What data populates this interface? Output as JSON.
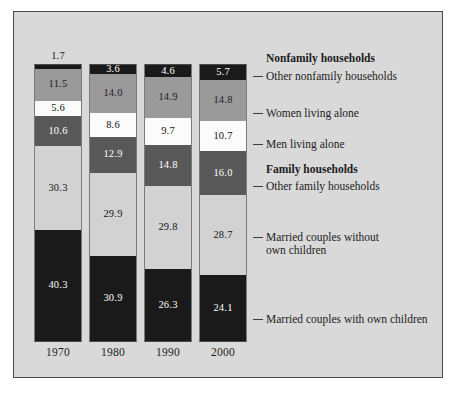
{
  "chart_data": {
    "type": "bar",
    "subtype": "stacked-100-percent",
    "title": "",
    "xlabel": "",
    "ylabel": "",
    "ylim": [
      0,
      100
    ],
    "grid": false,
    "legend_position": "right",
    "categories": [
      "1970",
      "1980",
      "1990",
      "2000"
    ],
    "series": [
      {
        "name": "Other nonfamily households",
        "color": "#1a1a1a",
        "values": [
          1.7,
          3.6,
          4.6,
          5.7
        ]
      },
      {
        "name": "Women living alone",
        "color": "#9a9a9a",
        "values": [
          11.5,
          14.0,
          14.9,
          14.8
        ]
      },
      {
        "name": "Men living alone",
        "color": "#fbfbfb",
        "values": [
          5.6,
          8.6,
          9.7,
          10.7
        ]
      },
      {
        "name": "Other family households",
        "color": "#585858",
        "values": [
          10.6,
          12.9,
          14.8,
          16.0
        ]
      },
      {
        "name": "Married couples without own children",
        "color": "#d2d2d2",
        "values": [
          30.3,
          29.9,
          29.8,
          28.7
        ]
      },
      {
        "name": "Married couples with own children",
        "color": "#1a1a1a",
        "values": [
          40.3,
          30.9,
          26.3,
          24.1
        ]
      }
    ],
    "group_headers": [
      "Nonfamily households",
      "Family households"
    ]
  },
  "bars": [
    {
      "year": "1970",
      "segments": [
        {
          "value": "1.7",
          "tone": "c-black",
          "pct": 1.7,
          "outside": true
        },
        {
          "value": "11.5",
          "tone": "c-mid",
          "pct": 11.5,
          "outside": false
        },
        {
          "value": "5.6",
          "tone": "c-white",
          "pct": 5.6,
          "outside": false
        },
        {
          "value": "10.6",
          "tone": "c-dark",
          "pct": 10.6,
          "outside": false
        },
        {
          "value": "30.3",
          "tone": "c-light",
          "pct": 30.3,
          "outside": false
        },
        {
          "value": "40.3",
          "tone": "c-black",
          "pct": 40.3,
          "outside": false
        }
      ]
    },
    {
      "year": "1980",
      "segments": [
        {
          "value": "3.6",
          "tone": "c-black",
          "pct": 3.6,
          "outside": false
        },
        {
          "value": "14.0",
          "tone": "c-mid",
          "pct": 14.0,
          "outside": false
        },
        {
          "value": "8.6",
          "tone": "c-white",
          "pct": 8.6,
          "outside": false
        },
        {
          "value": "12.9",
          "tone": "c-dark",
          "pct": 12.9,
          "outside": false
        },
        {
          "value": "29.9",
          "tone": "c-light",
          "pct": 29.9,
          "outside": false
        },
        {
          "value": "30.9",
          "tone": "c-black",
          "pct": 30.9,
          "outside": false
        }
      ]
    },
    {
      "year": "1990",
      "segments": [
        {
          "value": "4.6",
          "tone": "c-black",
          "pct": 4.6,
          "outside": false
        },
        {
          "value": "14.9",
          "tone": "c-mid",
          "pct": 14.9,
          "outside": false
        },
        {
          "value": "9.7",
          "tone": "c-white",
          "pct": 9.7,
          "outside": false
        },
        {
          "value": "14.8",
          "tone": "c-dark",
          "pct": 14.8,
          "outside": false
        },
        {
          "value": "29.8",
          "tone": "c-light",
          "pct": 29.8,
          "outside": false
        },
        {
          "value": "26.3",
          "tone": "c-black",
          "pct": 26.3,
          "outside": false
        }
      ]
    },
    {
      "year": "2000",
      "segments": [
        {
          "value": "5.7",
          "tone": "c-black",
          "pct": 5.7,
          "outside": false
        },
        {
          "value": "14.8",
          "tone": "c-mid",
          "pct": 14.8,
          "outside": false
        },
        {
          "value": "10.7",
          "tone": "c-white",
          "pct": 10.7,
          "outside": false
        },
        {
          "value": "16.0",
          "tone": "c-dark",
          "pct": 16.0,
          "outside": false
        },
        {
          "value": "28.7",
          "tone": "c-light",
          "pct": 28.7,
          "outside": false
        },
        {
          "value": "24.1",
          "tone": "c-black",
          "pct": 24.1,
          "outside": false
        }
      ]
    }
  ],
  "legend": [
    {
      "label": "Nonfamily households",
      "bold": true,
      "top": 40,
      "leader": false,
      "leader_top": 0
    },
    {
      "label": "Other nonfamily households",
      "bold": false,
      "top": 58,
      "leader": true,
      "leader_top": 64
    },
    {
      "label": "Women living alone",
      "bold": false,
      "top": 95,
      "leader": true,
      "leader_top": 101
    },
    {
      "label": "Men living alone",
      "bold": false,
      "top": 126,
      "leader": true,
      "leader_top": 132
    },
    {
      "label": "Family households",
      "bold": true,
      "top": 151,
      "leader": false,
      "leader_top": 0
    },
    {
      "label": "Other family households",
      "bold": false,
      "top": 168,
      "leader": true,
      "leader_top": 174
    },
    {
      "label": "Married couples without\nown children",
      "bold": false,
      "top": 219,
      "leader": true,
      "leader_top": 225
    },
    {
      "label": "Married couples with own children",
      "bold": false,
      "top": 301,
      "leader": true,
      "leader_top": 307
    }
  ]
}
